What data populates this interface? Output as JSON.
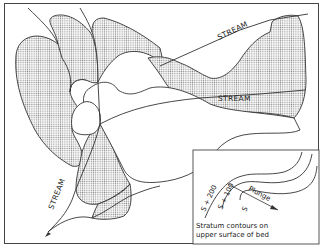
{
  "diagram": {
    "labels": {
      "stream_upper": "STREAM",
      "stream_middle": "STREAM",
      "stream_lower": "STREAM"
    },
    "inset": {
      "contour_labels": [
        "S + 200",
        "S + 100",
        "S"
      ],
      "arrow_label": "Plunge",
      "legend_line1": "Stratum contours on",
      "legend_line2": "upper surface of bed"
    },
    "colors": {
      "outline": "#333333",
      "stipple": "#9a9a9a",
      "background": "#ffffff"
    }
  }
}
